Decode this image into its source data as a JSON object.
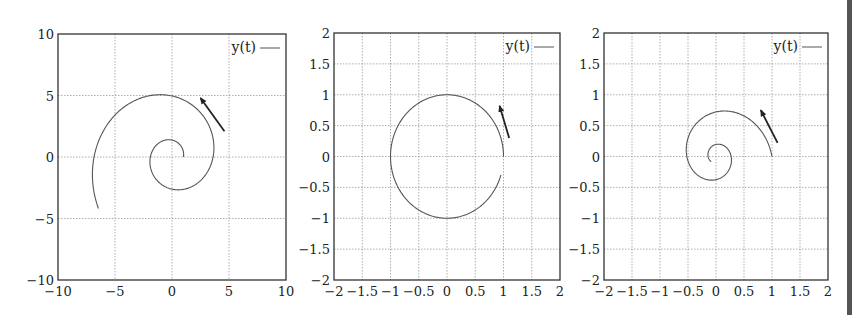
{
  "chart_data": [
    {
      "type": "line",
      "title": "",
      "xlabel": "",
      "ylabel": "",
      "xlim": [
        -10,
        10
      ],
      "ylim": [
        -10,
        10
      ],
      "xticks": [
        -10,
        -5,
        0,
        5,
        10
      ],
      "yticks": [
        -10,
        -5,
        0,
        5,
        10
      ],
      "grid": true,
      "legend": {
        "position": "upper right",
        "entries": [
          "y(t)"
        ]
      },
      "series": [
        {
          "name": "y(t)",
          "kind": "outward spiral (counterclockwise)",
          "start": [
            1,
            0
          ],
          "end": [
            -6.3,
            -4.0
          ],
          "points": [
            [
              1,
              0
            ],
            [
              0,
              1.38
            ],
            [
              -1.9,
              0
            ],
            [
              0,
              -2.6
            ],
            [
              3.6,
              0
            ],
            [
              0,
              4.97
            ],
            [
              -6.8,
              0
            ],
            [
              -6.3,
              -4.0
            ]
          ]
        }
      ],
      "annotations": [
        {
          "type": "arrow",
          "from": [
            4.6,
            2.1
          ],
          "to": [
            2.5,
            4.8
          ],
          "meaning": "direction of motion"
        }
      ]
    },
    {
      "type": "line",
      "title": "",
      "xlabel": "",
      "ylabel": "",
      "xlim": [
        -2,
        2
      ],
      "ylim": [
        -2,
        2
      ],
      "xticks": [
        -2,
        -1.5,
        -1,
        -0.5,
        0,
        0.5,
        1,
        1.5,
        2
      ],
      "yticks": [
        -2,
        -1.5,
        -1,
        -0.5,
        0,
        0.5,
        1,
        1.5,
        2
      ],
      "grid": true,
      "legend": {
        "position": "upper right",
        "entries": [
          "y(t)"
        ]
      },
      "series": [
        {
          "name": "y(t)",
          "kind": "circle (counterclockwise), radius 1",
          "start": [
            1,
            0
          ],
          "end": [
            0.95,
            -0.3
          ],
          "points": [
            [
              1,
              0
            ],
            [
              0,
              1
            ],
            [
              -1,
              0
            ],
            [
              0,
              -1
            ],
            [
              0.95,
              -0.3
            ]
          ]
        }
      ],
      "annotations": [
        {
          "type": "arrow",
          "from": [
            1.1,
            0.3
          ],
          "to": [
            0.93,
            0.82
          ],
          "meaning": "direction of motion"
        }
      ]
    },
    {
      "type": "line",
      "title": "",
      "xlabel": "",
      "ylabel": "",
      "xlim": [
        -2,
        2
      ],
      "ylim": [
        -2,
        2
      ],
      "xticks": [
        -2,
        -1.5,
        -1,
        -0.5,
        0,
        0.5,
        1,
        1.5,
        2
      ],
      "yticks": [
        -2,
        -1.5,
        -1,
        -0.5,
        0,
        0.5,
        1,
        1.5,
        2
      ],
      "grid": true,
      "legend": {
        "position": "upper right",
        "entries": [
          "y(t)"
        ]
      },
      "series": [
        {
          "name": "y(t)",
          "kind": "inward spiral (counterclockwise)",
          "start": [
            1,
            0
          ],
          "end": [
            -0.1,
            -0.07
          ],
          "points": [
            [
              1,
              0
            ],
            [
              0,
              0.72
            ],
            [
              -0.52,
              0
            ],
            [
              0,
              -0.38
            ],
            [
              0.27,
              0
            ],
            [
              0,
              0.2
            ],
            [
              -0.14,
              0
            ],
            [
              -0.1,
              -0.07
            ]
          ]
        }
      ],
      "annotations": [
        {
          "type": "arrow",
          "from": [
            1.1,
            0.22
          ],
          "to": [
            0.8,
            0.75
          ],
          "meaning": "direction of motion"
        }
      ]
    }
  ],
  "plots": [
    {
      "box": {
        "left": 58,
        "top": 34,
        "right": 286,
        "bottom": 280
      },
      "xlim": [
        -10,
        10
      ],
      "ylim": [
        -10,
        10
      ],
      "xtick_labels": [
        "−10",
        "−5",
        "0",
        "5",
        "10"
      ],
      "ytick_labels": [
        "−10",
        "−5",
        "0",
        "5",
        "10"
      ],
      "ticks": [
        -10,
        -5,
        0,
        5,
        10
      ],
      "legend_label": "y(t)",
      "curve": {
        "type": "spiral",
        "a": 1,
        "b": 0.204,
        "theta_end": 10.0
      },
      "arrow": {
        "from": [
          4.6,
          2.1
        ],
        "to": [
          2.5,
          4.8
        ]
      }
    },
    {
      "box": {
        "left": 334,
        "top": 33,
        "right": 560,
        "bottom": 280
      },
      "xlim": [
        -2,
        2
      ],
      "ylim": [
        -2,
        2
      ],
      "xtick_labels": [
        "−2",
        "−1.5",
        "−1",
        "−0.5",
        "0",
        "0.5",
        "1",
        "1.5",
        "2"
      ],
      "ytick_labels": [
        "−2",
        "−1.5",
        "−1",
        "−0.5",
        "0",
        "0.5",
        "1",
        "1.5",
        "2"
      ],
      "ticks": [
        -2,
        -1.5,
        -1,
        -0.5,
        0,
        0.5,
        1,
        1.5,
        2
      ],
      "legend_label": "y(t)",
      "curve": {
        "type": "spiral",
        "a": 1,
        "b": 0,
        "theta_end": 5.98
      },
      "arrow": {
        "from": [
          1.1,
          0.3
        ],
        "to": [
          0.93,
          0.82
        ]
      }
    },
    {
      "box": {
        "left": 604,
        "top": 33,
        "right": 828,
        "bottom": 280
      },
      "xlim": [
        -2,
        2
      ],
      "ylim": [
        -2,
        2
      ],
      "xtick_labels": [
        "−2",
        "−1.5",
        "−1",
        "−0.5",
        "0",
        "0.5",
        "1",
        "1.5",
        "2"
      ],
      "ytick_labels": [
        "−2",
        "−1.5",
        "−1",
        "−0.5",
        "0",
        "0.5",
        "1",
        "1.5",
        "2"
      ],
      "ticks": [
        -2,
        -1.5,
        -1,
        -0.5,
        0,
        0.5,
        1,
        1.5,
        2
      ],
      "legend_label": "y(t)",
      "curve": {
        "type": "spiral",
        "a": 1,
        "b": -0.208,
        "theta_end": 10.2
      },
      "arrow": {
        "from": [
          1.1,
          0.22
        ],
        "to": [
          0.8,
          0.75
        ]
      }
    }
  ],
  "colors": {
    "axis": "#333333",
    "grid": "#9a9a9a",
    "curve": "#555555",
    "arrow": "#222222",
    "page_bar": "#555555"
  }
}
